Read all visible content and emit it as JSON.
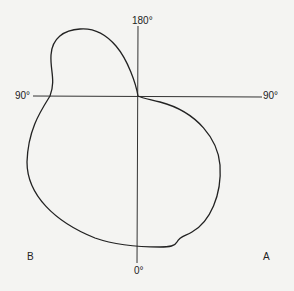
{
  "diagram": {
    "type": "polar-pattern",
    "axis_labels": {
      "top": "180°",
      "left": "90°",
      "right": "90°",
      "bottom": "0°"
    },
    "corner_labels": {
      "bottom_left": "B",
      "bottom_right": "A"
    },
    "colors": {
      "background": "#f4f4f2",
      "line": "#222222"
    }
  }
}
